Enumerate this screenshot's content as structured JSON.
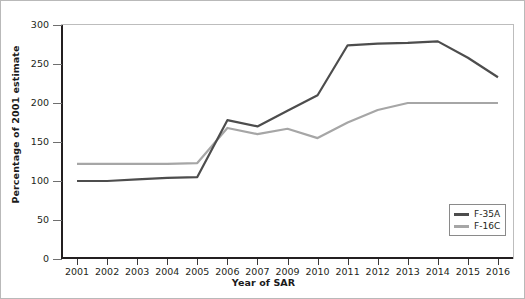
{
  "chart_data": {
    "type": "line",
    "title": "",
    "xlabel": "Year of SAR",
    "ylabel": "Percentage of 2001 estimate",
    "categories": [
      "2001",
      "2002",
      "2003",
      "2004",
      "2005",
      "2006",
      "2007",
      "2009",
      "2010",
      "2011",
      "2012",
      "2013",
      "2014",
      "2015",
      "2016"
    ],
    "ylim": [
      0,
      300
    ],
    "yticks": [
      0,
      50,
      100,
      150,
      200,
      250,
      300
    ],
    "grid": false,
    "legend_position": "bottom-right",
    "series": [
      {
        "name": "F-35A",
        "color": "#4d4d4d",
        "values": [
          100,
          100,
          102,
          104,
          105,
          178,
          170,
          190,
          210,
          274,
          276,
          277,
          279,
          258,
          233
        ]
      },
      {
        "name": "F-16C",
        "color": "#a6a6a6",
        "values": [
          122,
          122,
          122,
          122,
          123,
          168,
          160,
          167,
          155,
          175,
          191,
          200,
          200,
          200,
          200
        ]
      }
    ]
  },
  "legend": {
    "items": [
      {
        "label": "F-35A"
      },
      {
        "label": "F-16C"
      }
    ]
  },
  "axis": {
    "ytick_labels": [
      "300",
      "250",
      "200",
      "150",
      "100",
      "50",
      "0"
    ],
    "xtick_labels": [
      "2001",
      "2002",
      "2003",
      "2004",
      "2005",
      "2006",
      "2007",
      "2009",
      "2010",
      "2011",
      "2012",
      "2013",
      "2014",
      "2015",
      "2016"
    ]
  }
}
